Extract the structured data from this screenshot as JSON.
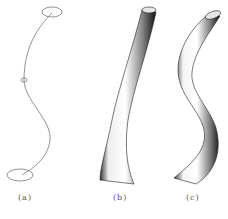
{
  "figure": {
    "panels": [
      {
        "id": "a",
        "label": "(a)",
        "description": "Skeleton curve with two end cross-section ellipses and a middle marker"
      },
      {
        "id": "b",
        "label": "(b)",
        "description": "Swept tube surface, slightly curved, flared base"
      },
      {
        "id": "c",
        "label": "(c)",
        "description": "Swept tube surface along S-shaped path"
      }
    ],
    "caption": "",
    "colors": {
      "line": "#777777",
      "shade_dark": "#222222",
      "shade_light": "#ffffff"
    }
  }
}
